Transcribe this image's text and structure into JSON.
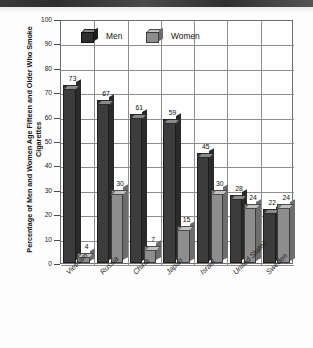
{
  "chart_data": {
    "type": "bar",
    "title": "",
    "xlabel": "",
    "ylabel": "Percentage of Men and Women Age Fifteen and Older Who Smoke Cigarettes",
    "ylim": [
      0,
      100
    ],
    "ytick_labels": [
      "100",
      "90",
      "80",
      "70",
      "60",
      "50",
      "40",
      "30",
      "20",
      "10",
      "0"
    ],
    "grid": true,
    "legend_position": "top-inside",
    "categories": [
      "Vietnam",
      "Russia",
      "China",
      "Japan",
      "Israel",
      "United States",
      "Sweden"
    ],
    "series": [
      {
        "name": "Men",
        "color": "#3c3c3c",
        "values": [
          73,
          67,
          61,
          59,
          45,
          28,
          22
        ]
      },
      {
        "name": "Women",
        "color": "#8d8d8d",
        "values": [
          4,
          30,
          7,
          15,
          30,
          24,
          24
        ]
      }
    ]
  },
  "legend": {
    "men_label": "Men",
    "women_label": "Women"
  }
}
